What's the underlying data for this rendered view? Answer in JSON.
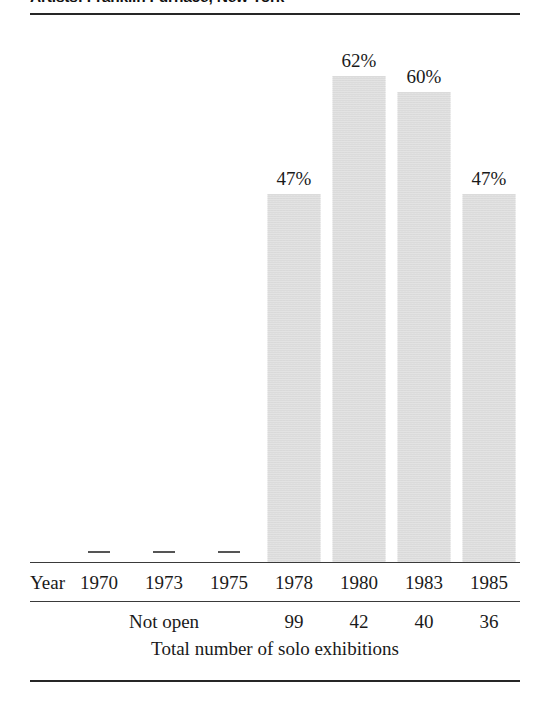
{
  "title": "Artists: Franklin Furnace, New York",
  "axis_row_label": "Year",
  "not_open_label": "Not open",
  "caption": "Total number of solo exhibitions",
  "colors": {
    "bar_fill": "#e3e3e3",
    "rule": "#262626",
    "text": "#1a1a1a"
  },
  "chart_data": {
    "type": "bar",
    "title": "Artists: Franklin Furnace, New York",
    "xlabel": "Year",
    "ylabel": "",
    "ylim": [
      0,
      100
    ],
    "grid": false,
    "legend": "none",
    "categories": [
      "1970",
      "1973",
      "1975",
      "1978",
      "1980",
      "1983",
      "1985"
    ],
    "values": [
      null,
      null,
      null,
      47,
      62,
      60,
      47
    ],
    "value_labels": [
      "—",
      "—",
      "—",
      "47%",
      "62%",
      "60%",
      "47%"
    ],
    "value_unit": "%",
    "missing_note": "Not open",
    "missing_categories": [
      "1970",
      "1973",
      "1975"
    ],
    "secondary_series": {
      "name": "Total number of solo exhibitions",
      "values": [
        null,
        null,
        null,
        99,
        42,
        40,
        36
      ],
      "labels": [
        "",
        "",
        "",
        "99",
        "42",
        "40",
        "36"
      ]
    }
  },
  "bars": [
    {
      "year": "1970",
      "label": "",
      "pct": null,
      "count": "",
      "dash": true
    },
    {
      "year": "1973",
      "label": "",
      "pct": null,
      "count": "",
      "dash": true
    },
    {
      "year": "1975",
      "label": "",
      "pct": null,
      "count": "",
      "dash": true
    },
    {
      "year": "1978",
      "label": "47%",
      "pct": 47,
      "count": "99",
      "dash": false
    },
    {
      "year": "1980",
      "label": "62%",
      "pct": 62,
      "count": "42",
      "dash": false
    },
    {
      "year": "1983",
      "label": "60%",
      "pct": 60,
      "count": "40",
      "dash": false
    },
    {
      "year": "1985",
      "label": "47%",
      "pct": 47,
      "count": "36",
      "dash": false
    }
  ]
}
